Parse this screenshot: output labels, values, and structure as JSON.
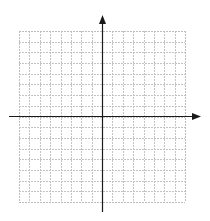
{
  "diagram": {
    "type": "coordinate-plane",
    "grid": {
      "columns": 16,
      "rows": 16,
      "left": 19,
      "top": 31,
      "right": 185,
      "bottom": 202,
      "line_color": "#c4c4c4",
      "border_color": "#bdbdbd",
      "dashed": true
    },
    "axes": {
      "color": "#1a1a1a",
      "x_axis": {
        "y": 116,
        "x_start": 9,
        "x_end": 201,
        "arrow_right": true
      },
      "y_axis": {
        "x": 102,
        "y_start": 15,
        "y_end": 212,
        "arrow_up": true
      }
    },
    "labels": []
  }
}
